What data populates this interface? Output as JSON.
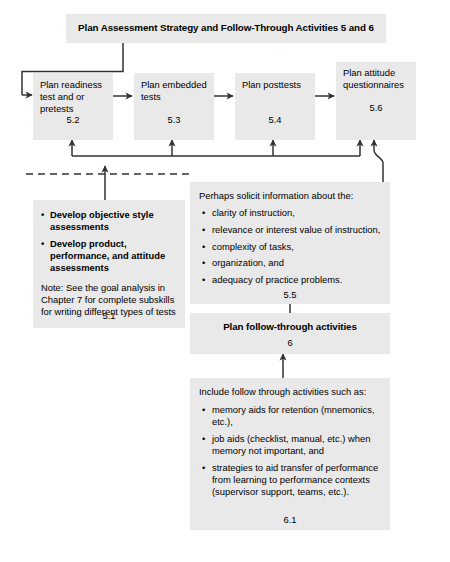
{
  "header": {
    "title": "Plan Assessment Strategy and Follow-Through Activities 5 and 6"
  },
  "colors": {
    "box_fill": "#e9e9e9",
    "line": "#333333",
    "text": "#000000"
  },
  "flow_row": [
    {
      "label": "Plan readiness test and or pretests",
      "number": "5.2",
      "name": "plan-readiness-test"
    },
    {
      "label": "Plan embedded tests",
      "number": "5.3",
      "name": "plan-embedded-tests"
    },
    {
      "label": "Plan posttests",
      "number": "5.4",
      "name": "plan-posttests"
    },
    {
      "label": "Plan attitude questionnaires",
      "number": "5.6",
      "name": "plan-attitude-questionnaires"
    }
  ],
  "assessment_block": {
    "bullets": [
      "Develop objective style assessments",
      "Develop product, performance, and attitude assessments"
    ],
    "note": "Note: See the goal analysis in Chapter 7 for complete subskills for writing different types of tests",
    "number": "5.1"
  },
  "solicit_block": {
    "heading": "Perhaps solicit information about the:",
    "bullets": [
      "clarity of instruction,",
      "relevance or interest value of instruction,",
      "complexity of tasks,",
      "organization, and",
      "adequacy of practice problems."
    ],
    "number": "5.5"
  },
  "follow_through_box": {
    "title": "Plan follow-through activities",
    "number": "6"
  },
  "follow_through_detail": {
    "heading": "Include follow through activities such as:",
    "bullets": [
      "memory aids for retention (mnemonics, etc.),",
      "job aids (checklist, manual, etc.) when memory not important, and",
      "strategies to aid transfer of performance from learning to performance contexts (supervisor support, teams, etc.)."
    ],
    "number": "6.1"
  },
  "bullet_glyph": "•"
}
